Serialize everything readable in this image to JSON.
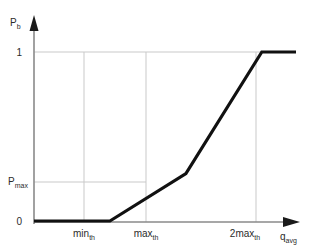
{
  "chart_data": {
    "type": "line",
    "title": "",
    "subtitle": "",
    "xlabel": "q_avg",
    "ylabel": "P_b",
    "xlabel_base": "q",
    "xlabel_sub": "avg",
    "ylabel_base": "P",
    "ylabel_sub": "b",
    "grid": true,
    "legend": "none",
    "xlim": [
      0,
      3.1
    ],
    "ylim": [
      0,
      1.15
    ],
    "x_tick_values": [
      1,
      2,
      3
    ],
    "x_tick_labels": [
      "min_th",
      "max_th",
      "2max_th"
    ],
    "x_tick_parts": [
      {
        "base": "min",
        "sub": "th"
      },
      {
        "base": "max",
        "sub": "th"
      },
      {
        "base": "2max",
        "sub": "th"
      }
    ],
    "y_tick_values": [
      0,
      0.28,
      1
    ],
    "y_tick_labels": [
      "0",
      "P_max",
      "1"
    ],
    "y_tick_parts": [
      {
        "base": "0",
        "sub": ""
      },
      {
        "base": "P",
        "sub": "max"
      },
      {
        "base": "1",
        "sub": ""
      }
    ],
    "series": [
      {
        "name": "drop probability",
        "x": [
          0.0,
          1.0,
          2.0,
          3.0,
          3.45
        ],
        "y": [
          0.0,
          0.0,
          0.28,
          1.0,
          1.0
        ]
      }
    ],
    "annotations": [],
    "colors": {
      "curve": "#111111",
      "axis": "#8a8a8a",
      "grid": "#c9c9c9",
      "text": "#2b2b2b",
      "background": "#ffffff"
    }
  }
}
